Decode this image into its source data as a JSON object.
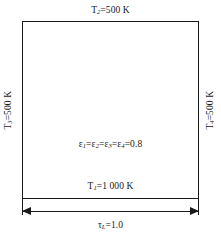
{
  "figure": {
    "name": "square-enclosure-radiation-diagram",
    "enclosure": {
      "surfaces": {
        "top_label_html": "T<sub>2</sub>=500 K",
        "bottom_label_html": "T<sub>1</sub>=1 000 K",
        "left_label_html": "T<sub>3</sub>=500 K",
        "right_label_html": "T<sub>4</sub>=500 K"
      },
      "emissivity_label_html": "&#949;<sub>1</sub>=&#949;<sub>2</sub>=&#949;<sub>3</sub>=&#949;<sub>4</sub>=0.8",
      "dimension_label_html": "&#964;<sub>L</sub>=1.0"
    },
    "values": {
      "T1": "1 000 K",
      "T2": "500 K",
      "T3": "500 K",
      "T4": "500 K",
      "emissivity": "0.8",
      "optical_thickness": "1.0"
    },
    "colors": {
      "stroke": "#1a1a1a",
      "background": "#ffffff",
      "text": "#1a1a1a"
    }
  }
}
